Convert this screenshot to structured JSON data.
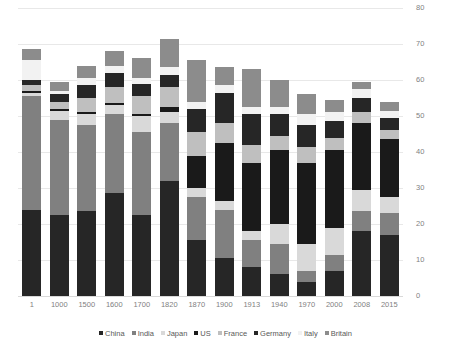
{
  "chart_data": {
    "type": "bar",
    "stacked": true,
    "title": "",
    "subtitle": "",
    "xlabel": "",
    "ylabel": "",
    "ylim": [
      0,
      80
    ],
    "ytick_step": 10,
    "yticks": [
      "0",
      "10",
      "20",
      "30",
      "40",
      "50",
      "60",
      "70",
      "80"
    ],
    "grid": true,
    "grid_axis": "y",
    "legend_position": "bottom",
    "categories": [
      "1",
      "1000",
      "1500",
      "1600",
      "1700",
      "1820",
      "1870",
      "1900",
      "1913",
      "1940",
      "1970",
      "2000",
      "2008",
      "2015"
    ],
    "series": [
      {
        "name": "China",
        "color": "#262626",
        "values": [
          24.0,
          22.5,
          23.5,
          28.5,
          22.5,
          32.0,
          15.5,
          10.5,
          8.0,
          6.0,
          4.0,
          7.0,
          18.0,
          17.0
        ]
      },
      {
        "name": "India",
        "color": "#808080",
        "values": [
          31.5,
          26.5,
          24.0,
          22.0,
          23.0,
          16.0,
          12.0,
          13.5,
          7.5,
          8.5,
          3.0,
          4.5,
          5.5,
          6.0
        ]
      },
      {
        "name": "Japan",
        "color": "#d9d9d9",
        "values": [
          1.0,
          2.5,
          3.0,
          2.5,
          4.5,
          3.0,
          2.5,
          2.5,
          2.5,
          5.5,
          7.5,
          7.5,
          6.0,
          4.5
        ]
      },
      {
        "name": "US",
        "color": "#1a1a1a",
        "values": [
          0.5,
          0.5,
          0.5,
          0.5,
          0.5,
          1.5,
          9.0,
          16.0,
          19.0,
          20.5,
          22.5,
          21.5,
          18.5,
          16.0
        ]
      },
      {
        "name": "France",
        "color": "#bfbfbf",
        "values": [
          1.5,
          2.0,
          4.0,
          4.5,
          5.0,
          5.5,
          6.5,
          5.5,
          5.0,
          4.0,
          4.5,
          3.5,
          3.0,
          2.5
        ]
      },
      {
        "name": "Germany",
        "color": "#262626",
        "values": [
          1.5,
          2.0,
          3.5,
          4.0,
          3.5,
          3.5,
          6.5,
          8.5,
          8.5,
          6.0,
          6.0,
          4.5,
          4.0,
          3.5
        ]
      },
      {
        "name": "Italy",
        "color": "#f2f2f2",
        "values": [
          5.5,
          1.0,
          2.0,
          2.0,
          1.5,
          2.0,
          2.0,
          2.0,
          2.0,
          2.0,
          3.0,
          2.5,
          2.5,
          2.0
        ]
      },
      {
        "name": "Britain",
        "color": "#8c8c8c",
        "values": [
          3.0,
          2.5,
          3.5,
          4.0,
          5.5,
          8.0,
          11.5,
          5.0,
          10.5,
          7.5,
          5.5,
          3.5,
          2.0,
          2.5
        ]
      }
    ],
    "totals": [
      68.5,
      59.5,
      64.0,
      68.0,
      66.0,
      71.5,
      65.5,
      63.5,
      63.0,
      60.0,
      56.0,
      54.5,
      59.5,
      54.0
    ]
  },
  "legend": {
    "items": [
      {
        "label": "China"
      },
      {
        "label": "India"
      },
      {
        "label": "Japan"
      },
      {
        "label": "US"
      },
      {
        "label": "France"
      },
      {
        "label": "Germany"
      },
      {
        "label": "Italy"
      },
      {
        "label": "Britain"
      }
    ]
  },
  "colors": {
    "background": "#ffffff",
    "gridline": "#e8e8e8",
    "axis_text": "#7f7f7f",
    "legend_text": "#595959"
  }
}
